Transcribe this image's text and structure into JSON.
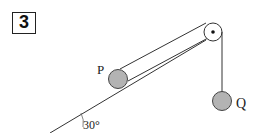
{
  "problem": {
    "number": "3"
  },
  "labels": {
    "p": "P",
    "q": "Q",
    "angle": "30°"
  },
  "colors": {
    "line": "#333333",
    "ball_fill": "#b3b3b3",
    "ball_stroke": "#444444",
    "background": "#ffffff"
  },
  "diagram": {
    "incline_angle_deg": 30,
    "objects": [
      "block P on incline",
      "pulley at top",
      "hanging mass Q"
    ]
  }
}
